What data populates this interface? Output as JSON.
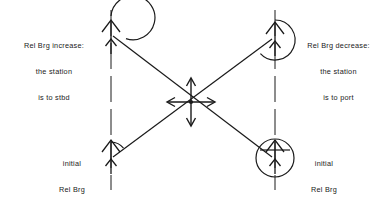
{
  "figure": {
    "background_color": "#ffffff",
    "stroke_color": "#1a1a1a",
    "width": 390,
    "height": 200
  },
  "labels": {
    "top_left": {
      "line1": "Rel Brg increase:",
      "line2": "the station",
      "line3": "is to stbd"
    },
    "top_right": {
      "line1": "Rel Brg decrease:",
      "line2": "the station",
      "line3": "is to port"
    },
    "bottom_left": {
      "line1": "initial",
      "line2": "Rel Brg"
    },
    "bottom_right": {
      "line1": "initial",
      "line2": "Rel Brg"
    }
  },
  "elements": {
    "reference_line_left": "vertical-dashed-heading-line",
    "reference_line_right": "vertical-dashed-heading-line",
    "ship_top_left": "ship-heading-arrow",
    "ship_top_right": "ship-heading-arrow",
    "ship_bottom_left": "ship-heading-arrow",
    "ship_bottom_right": "ship-heading-arrow",
    "station_marker": "four-way-arrow-station",
    "bearing_line_descending": "bearing-line",
    "bearing_line_ascending": "bearing-line"
  },
  "geometry": {
    "left_line_x": 111,
    "right_line_x": 275,
    "line_top_y": 10,
    "line_bottom_y": 190,
    "station_x": 191,
    "station_y": 102,
    "ship_top_y": 38,
    "ship_bottom_y": 158
  }
}
